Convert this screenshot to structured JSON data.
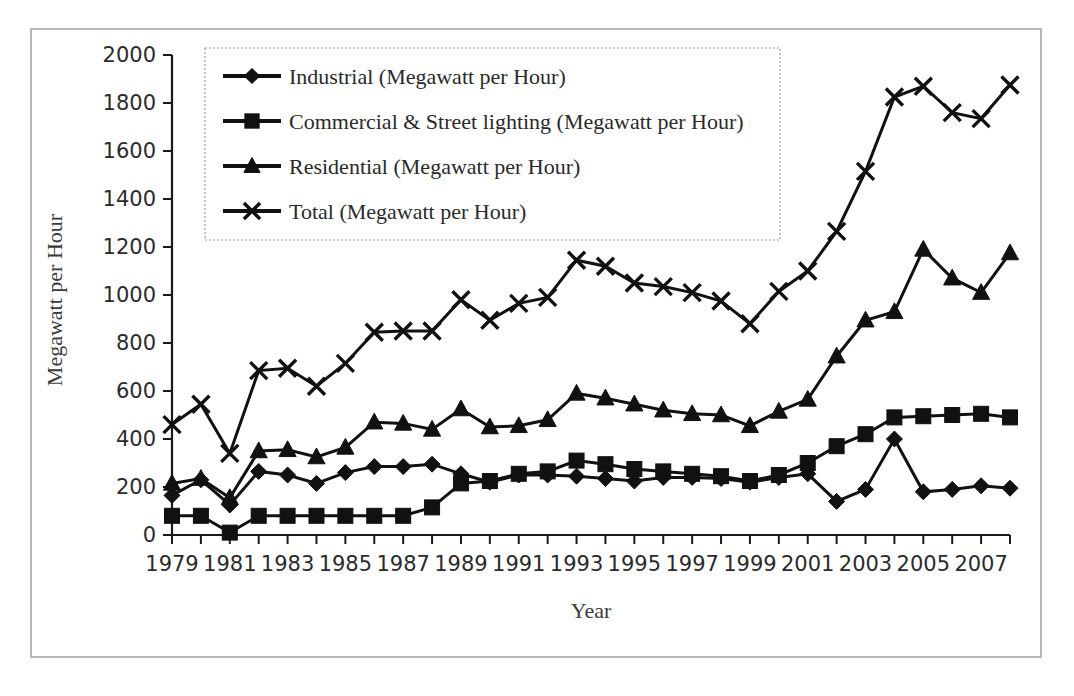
{
  "chart_data": {
    "type": "line",
    "title": "",
    "xlabel": "Year",
    "ylabel": "Megawatt per Hour",
    "ylim": [
      0,
      2000
    ],
    "ytick_step": 200,
    "yticks": [
      0,
      200,
      400,
      600,
      800,
      1000,
      1200,
      1400,
      1600,
      1800,
      2000
    ],
    "xlim": [
      1979,
      2008
    ],
    "xticks_labeled": [
      1979,
      1981,
      1983,
      1985,
      1987,
      1989,
      1991,
      1993,
      1995,
      1997,
      1999,
      2001,
      2003,
      2005,
      2007
    ],
    "x": [
      1979,
      1980,
      1981,
      1982,
      1983,
      1984,
      1985,
      1986,
      1987,
      1988,
      1989,
      1990,
      1991,
      1992,
      1993,
      1994,
      1995,
      1996,
      1997,
      1998,
      1999,
      2000,
      2001,
      2002,
      2003,
      2004,
      2005,
      2006,
      2007,
      2008
    ],
    "grid": false,
    "legend_position": "top-left",
    "marker_shapes": [
      "diamond",
      "square",
      "triangle",
      "x"
    ],
    "series": [
      {
        "name": "Industrial (Megawatt per Hour)",
        "marker": "diamond",
        "values": [
          165,
          230,
          125,
          265,
          250,
          215,
          260,
          285,
          285,
          295,
          255,
          220,
          250,
          250,
          245,
          235,
          225,
          240,
          240,
          235,
          220,
          240,
          255,
          140,
          190,
          400,
          180,
          190,
          205,
          195
        ]
      },
      {
        "name": "Commercial & Street lighting (Megawatt per Hour)",
        "marker": "square",
        "values": [
          80,
          80,
          10,
          80,
          80,
          80,
          80,
          80,
          80,
          115,
          215,
          225,
          255,
          265,
          310,
          295,
          275,
          265,
          255,
          245,
          225,
          250,
          300,
          370,
          420,
          490,
          495,
          500,
          505,
          490
        ]
      },
      {
        "name": "Residential (Megawatt per Hour)",
        "marker": "triangle",
        "values": [
          215,
          235,
          155,
          350,
          355,
          325,
          365,
          470,
          465,
          440,
          525,
          450,
          455,
          480,
          590,
          570,
          545,
          520,
          505,
          500,
          455,
          515,
          565,
          745,
          895,
          930,
          1190,
          1070,
          1010,
          1175
        ]
      },
      {
        "name": "Total (Megawatt per Hour)",
        "marker": "x",
        "values": [
          460,
          545,
          340,
          685,
          695,
          620,
          715,
          845,
          850,
          850,
          980,
          895,
          965,
          990,
          1145,
          1120,
          1050,
          1035,
          1010,
          975,
          880,
          1015,
          1100,
          1265,
          1515,
          1825,
          1870,
          1760,
          1735,
          1875
        ]
      }
    ]
  },
  "axes": {
    "ylabel": "Megawatt per Hour",
    "xlabel": "Year"
  }
}
